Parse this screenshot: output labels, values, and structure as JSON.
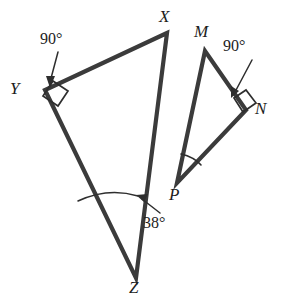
{
  "figure": {
    "kind": "geometry-diagram",
    "background_color": "#ffffff",
    "line_color": "#3b3b3b",
    "text_color": "#1d1d1d"
  },
  "triangles": [
    {
      "id": "xyz",
      "name": "triangle-xyz",
      "vertices": [
        {
          "label": "X",
          "x": 167,
          "y": 33,
          "label_x": 159,
          "label_y": 8
        },
        {
          "label": "Y",
          "x": 45,
          "y": 90,
          "label_x": 10,
          "label_y": 80
        },
        {
          "label": "Z",
          "x": 136,
          "y": 278,
          "label_x": 129,
          "label_y": 279
        }
      ],
      "path": "M 167 33 L 45 90 L 136 278 Z"
    },
    {
      "id": "mnp",
      "name": "triangle-mnp",
      "vertices": [
        {
          "label": "M",
          "x": 205,
          "y": 51,
          "label_x": 194,
          "label_y": 23
        },
        {
          "label": "N",
          "x": 246,
          "y": 110,
          "label_x": 255,
          "label_y": 100
        },
        {
          "label": "P",
          "x": 177,
          "y": 183,
          "label_x": 169,
          "label_y": 186
        }
      ],
      "path": "M 205 51 L 246 110 L 177 183 Z"
    }
  ],
  "angle_marks": [
    {
      "name": "right-angle-at-y",
      "vertex": "Y",
      "measure": "90°",
      "marker_path": "M 53 81 L 68 91 L 58 106 L 43 96 Z"
    },
    {
      "name": "right-angle-at-n",
      "vertex": "N",
      "measure": "90°",
      "marker_path": "M 234 98 L 246 90 L 256 103 L 243 112 Z"
    },
    {
      "name": "angle-arc-at-z",
      "vertex": "Z",
      "measure": "38°",
      "arc_path": "M 78 201 Q 108 187 138 196"
    },
    {
      "name": "angle-arc-at-p",
      "vertex": "P",
      "measure": "",
      "arc_path": "M 181 154 Q 194 157 201 165"
    }
  ],
  "labels": {
    "angle_90_left": {
      "name": "angle-label-90-left",
      "text": "90°",
      "x": 40,
      "y": 31,
      "leader": {
        "path": "M 58 52 L 50 82",
        "head": "M 50 88 L 46 76 L 55 76 Z"
      }
    },
    "angle_90_right": {
      "name": "angle-label-90-right",
      "text": "90°",
      "x": 223,
      "y": 38,
      "leader": {
        "path": "M 252 60 L 235 92",
        "head": "M 231 98 L 231 86 L 239 91 Z"
      }
    },
    "angle_38": {
      "name": "angle-label-38",
      "text": "38°",
      "x": 143,
      "y": 215,
      "leader": {
        "path": "M 160 213 L 142 199",
        "head": "M 136 195 L 148 194 L 144 202 Z"
      }
    }
  },
  "vertex_labels": {
    "x": "X",
    "y": "Y",
    "z": "Z",
    "m": "M",
    "n": "N",
    "p": "P"
  },
  "angle_values": {
    "y_angle": "90°",
    "n_angle": "90°",
    "z_angle": "38°"
  }
}
